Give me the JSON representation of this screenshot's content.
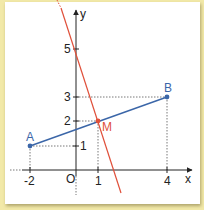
{
  "diagram": {
    "type": "coordinate-plane",
    "axes": {
      "x_label": "x",
      "y_label": "y",
      "origin_label": "O",
      "x_ticks": [
        "-2",
        "1",
        "4"
      ],
      "y_ticks": [
        "1",
        "2",
        "3",
        "5"
      ]
    },
    "points": [
      {
        "name": "A",
        "x": -2,
        "y": 1,
        "color": "#3b66a8"
      },
      {
        "name": "B",
        "x": 4,
        "y": 3,
        "color": "#3b66a8"
      },
      {
        "name": "M",
        "x": 1,
        "y": 2,
        "color": "#e0503a"
      }
    ],
    "segments": [
      {
        "from": "A",
        "to": "B",
        "color": "#3b66a8"
      }
    ],
    "lines": [
      {
        "description": "line through (0,5) and M(1,2)",
        "color": "#e0503a"
      }
    ],
    "colors": {
      "background": "#f2e9a8",
      "panel": "#ffffff",
      "axis": "#222222",
      "segment": "#3b66a8",
      "line": "#e0503a"
    }
  }
}
